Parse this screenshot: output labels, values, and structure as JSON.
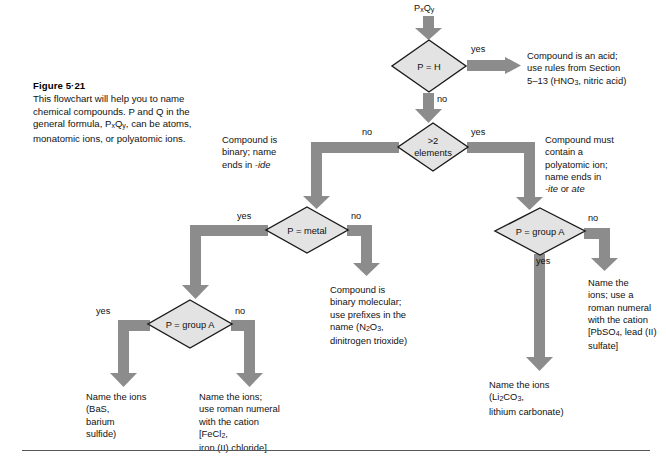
{
  "figure": {
    "title": "Figure 5·21",
    "caption": "This flowchart will help you to name\nchemical compounds. P and Q in the\ngeneral formula, PxQy, can be atoms,\nmonatomic ions, or polyatomic ions."
  },
  "colors": {
    "arrow": "#8c8c8c",
    "diamond_fill": "#e3e3e3",
    "diamond_stroke": "#1a1a1a",
    "text": "#111111",
    "rule": "#555555"
  },
  "start": {
    "label": "PxQy"
  },
  "decisions": [
    {
      "id": "p-is-h",
      "label": "P = H"
    },
    {
      "id": "more-than-two-elements",
      "label_line1": ">2",
      "label_line2": "elements"
    },
    {
      "id": "p-is-metal",
      "label": "P = metal"
    },
    {
      "id": "p-is-group-a-left",
      "label": "P = group A"
    },
    {
      "id": "p-is-group-a-right",
      "label": "P = group A"
    }
  ],
  "branch_labels": {
    "p_is_h_yes": "yes",
    "p_is_h_no": "no",
    "elements_yes": "yes",
    "elements_no": "no",
    "metal_yes": "yes",
    "metal_no": "no",
    "group_a_left_yes": "yes",
    "group_a_left_no": "no",
    "group_a_right_yes": "yes",
    "group_a_right_no": "no"
  },
  "outcomes": {
    "acid": "Compound is an acid;\nuse rules from Section\n5–13 (HNO3, nitric acid)",
    "binary": "Compound is\nbinary; name\nends in -ide",
    "polyatomic": "Compound must\ncontain a\npolyatomic ion;\nname ends in\n-ite or ate",
    "binary_molecular": "Compound is\nbinary molecular;\nuse prefixes in the\nname (N2O3,\ndinitrogen trioxide)",
    "name_ions_bas": "Name the ions\n(BaS,\nbarium\nsulfide)",
    "name_ions_fecl2": "Name the ions;\nuse roman numeral\nwith the cation\n[FeCl2,\niron (II) chloride]",
    "name_ions_pbso4": "Name the\nions; use a\nroman numeral\nwith the cation\n[PbSO4, lead (II)\nsulfate]",
    "name_ions_li2co3": "Name the ions\n(Li2CO3,\nlithium carbonate)"
  }
}
